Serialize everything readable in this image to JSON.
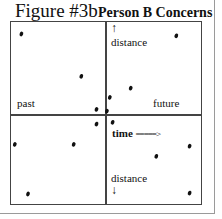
{
  "figure": {
    "title": "Figure #3b",
    "subtitle": "Person B Concerns"
  },
  "axes": {
    "left_label": "past",
    "right_label": "future",
    "top_label": "distance",
    "top_arrow": "↑",
    "time_label": "time",
    "time_arrow": "=====>",
    "bottom_label": "distance",
    "bottom_arrow": "↓"
  },
  "chart_data": {
    "type": "scatter",
    "xlabel": "time (past ← → future)",
    "ylabel": "distance",
    "xlim": [
      -1,
      1
    ],
    "ylim": [
      -1,
      1
    ],
    "grid": false,
    "quadrant_axes": true,
    "points": [
      {
        "x": -0.88,
        "y": 0.87
      },
      {
        "x": -0.25,
        "y": 0.41
      },
      {
        "x": 0.75,
        "y": 0.85
      },
      {
        "x": 0.27,
        "y": 0.28
      },
      {
        "x": 0.05,
        "y": 0.18
      },
      {
        "x": -0.09,
        "y": 0.05
      },
      {
        "x": 0.02,
        "y": 0.03
      },
      {
        "x": -0.09,
        "y": -0.11
      },
      {
        "x": 0.08,
        "y": -0.09
      },
      {
        "x": -0.95,
        "y": -0.33
      },
      {
        "x": -0.33,
        "y": -0.33
      },
      {
        "x": 0.89,
        "y": -0.35
      },
      {
        "x": 0.54,
        "y": -0.46
      },
      {
        "x": -0.81,
        "y": -0.87
      },
      {
        "x": 0.89,
        "y": -0.86
      }
    ]
  }
}
